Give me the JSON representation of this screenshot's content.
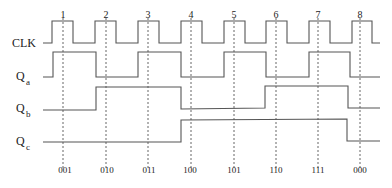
{
  "diagram": {
    "type": "timing-diagram",
    "signals": [
      {
        "name": "CLK",
        "label": "CLK",
        "subscript": ""
      },
      {
        "name": "Qa",
        "label": "Q",
        "subscript": "a"
      },
      {
        "name": "Qb",
        "label": "Q",
        "subscript": "b"
      },
      {
        "name": "Qc",
        "label": "Q",
        "subscript": "c"
      }
    ],
    "clock_edges": [
      "1",
      "2",
      "3",
      "4",
      "5",
      "6",
      "7",
      "8"
    ],
    "states": [
      "001",
      "010",
      "011",
      "100",
      "101",
      "110",
      "111",
      "000"
    ],
    "waveforms": {
      "CLK": "0,1,0,1,0,1,0,1,0,1,0,1,0,1,0,1,0",
      "Qa": "0 → 1 → 0 → 1 → 0 → 1 → 0 → 1 → 0",
      "Qb": "0 → 1 → 0 → 1 → 0",
      "Qc": "0 → 1 → 0"
    },
    "colors": {
      "line": "#555555",
      "text": "#222222",
      "background": "#ffffff"
    }
  }
}
